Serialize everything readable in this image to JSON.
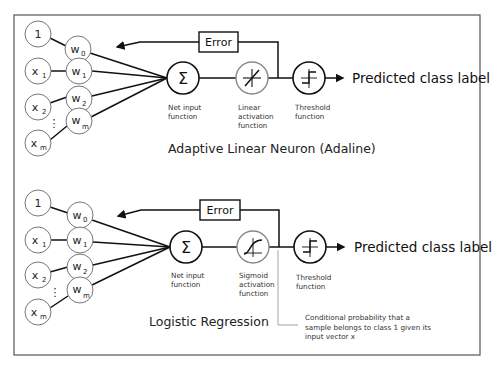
{
  "frame": {
    "border_color": "#555555",
    "background": "#ffffff"
  },
  "diagrams": [
    {
      "title": "Adaptive Linear Neuron (Adaline)",
      "inputs": [
        "1",
        "x1",
        "x2",
        "xm"
      ],
      "inputs_display": [
        {
          "base": "1",
          "sub": ""
        },
        {
          "base": "x",
          "sub": "1"
        },
        {
          "base": "x",
          "sub": "2"
        },
        {
          "base": "x",
          "sub": "m"
        }
      ],
      "weights_display": [
        {
          "base": "w",
          "sub": "0"
        },
        {
          "base": "w",
          "sub": "1"
        },
        {
          "base": "w",
          "sub": "2"
        },
        {
          "base": "w",
          "sub": "m"
        }
      ],
      "ellipsis": "⋮",
      "error_label": "Error",
      "net_input": {
        "symbol": "Σ",
        "label_lines": [
          "Net input",
          "function"
        ]
      },
      "activation": {
        "type": "linear",
        "label_lines": [
          "Linear",
          "activation",
          "function"
        ]
      },
      "threshold": {
        "label_lines": [
          "Threshold",
          "function"
        ]
      },
      "output_label": "Predicted class label"
    },
    {
      "title": "Logistic Regression",
      "inputs": [
        "1",
        "x1",
        "x2",
        "xm"
      ],
      "inputs_display": [
        {
          "base": "1",
          "sub": ""
        },
        {
          "base": "x",
          "sub": "1"
        },
        {
          "base": "x",
          "sub": "2"
        },
        {
          "base": "x",
          "sub": "m"
        }
      ],
      "weights_display": [
        {
          "base": "w",
          "sub": "0"
        },
        {
          "base": "w",
          "sub": "1"
        },
        {
          "base": "w",
          "sub": "2"
        },
        {
          "base": "w",
          "sub": "m"
        }
      ],
      "ellipsis": "⋮",
      "error_label": "Error",
      "net_input": {
        "symbol": "Σ",
        "label_lines": [
          "Net input",
          "function"
        ]
      },
      "activation": {
        "type": "sigmoid",
        "label_lines": [
          "Sigmoid",
          "activation",
          "function"
        ]
      },
      "threshold": {
        "label_lines": [
          "Threshold",
          "function"
        ]
      },
      "output_label": "Predicted class label",
      "annotation_lines": [
        "Conditional probability that a",
        "sample belongs to class 1 given its",
        "input vector x"
      ]
    }
  ]
}
